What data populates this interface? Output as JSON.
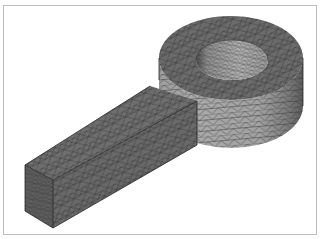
{
  "figure": {
    "colors": {
      "background": "#ffffff",
      "frame_border": "#bdbdbd",
      "bar_top": "#6e6e6e",
      "bar_side": "#696969",
      "bar_end": "#5e5e5e",
      "ring_top": "#6b6b6b",
      "ring_side_light": "#a6a6a6",
      "ring_side_dark": "#6f6f6f",
      "hole_wall": "#aaaaaa",
      "mesh_lines": "#2a2a2a"
    }
  }
}
